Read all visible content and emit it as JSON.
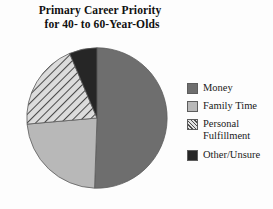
{
  "chart_data": {
    "type": "pie",
    "title": "Primary Career Priority for 40- to 60-Year-Olds",
    "title_line1": "Primary Career Priority",
    "title_line2": "for 40- to 60-Year-Olds",
    "xlabel": "",
    "ylabel": "",
    "grid": false,
    "legend_position": "right",
    "start_angle_deg": 0,
    "direction": "clockwise",
    "categories": [
      "Money",
      "Family Time",
      "Personal Fulfillment",
      "Other/Unsure"
    ],
    "values": [
      50.5,
      23.0,
      20.0,
      6.5
    ],
    "value_unit": "percent",
    "slices": [
      {
        "label": "Money",
        "value": 50.5,
        "color": "#6e6e6e",
        "fill": "solid",
        "start_angle_deg": 0,
        "end_angle_deg": 182
      },
      {
        "label": "Family Time",
        "value": 23.0,
        "color": "#b8b8b8",
        "fill": "solid",
        "start_angle_deg": 182,
        "end_angle_deg": 265
      },
      {
        "label": "Personal Fulfillment",
        "value": 20.0,
        "color": "#d7d7d7",
        "fill": "diagonal-hatch",
        "hatch_color": "#4f4f4f",
        "start_angle_deg": 265,
        "end_angle_deg": 337
      },
      {
        "label": "Other/Unsure",
        "value": 6.5,
        "color": "#262626",
        "fill": "solid",
        "start_angle_deg": 337,
        "end_angle_deg": 360
      }
    ]
  },
  "legend": {
    "items": [
      {
        "label": "Money",
        "swatch": "money-swatch"
      },
      {
        "label": "Family Time",
        "swatch": "family-time-swatch"
      },
      {
        "label": "Personal\nFulfillment",
        "swatch": "personal-fulfillment-swatch"
      },
      {
        "label": "Other/Unsure",
        "swatch": "other-unsure-swatch"
      }
    ]
  },
  "colors": {
    "money": "#6e6e6e",
    "family_time": "#b8b8b8",
    "personal_fulfillment": "#d7d7d7",
    "other_unsure": "#262626",
    "outline": "#5d5d5d",
    "background": "#fdfdfd",
    "text": "#111111"
  }
}
